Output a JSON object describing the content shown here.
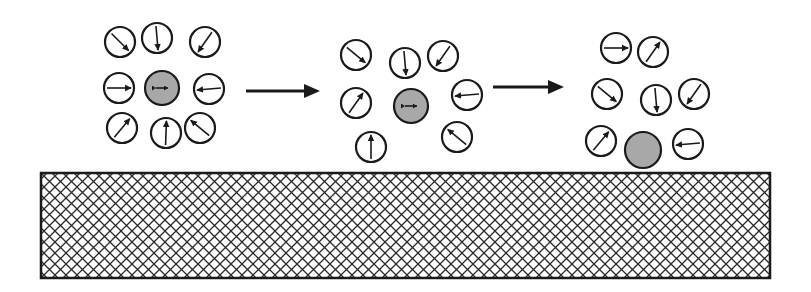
{
  "diagram": {
    "type": "process-sequence",
    "colors": {
      "stroke": "#1a1a1a",
      "particle_fill": "#a8a8a8",
      "background": "#ffffff",
      "hatch": "#2a2a2a"
    },
    "stages": [
      {
        "label": "stage-1",
        "particle": {
          "cx": 162,
          "cy": 88,
          "r": 17,
          "has_double_arrow": true
        },
        "dipoles": [
          {
            "cx": 120,
            "cy": 42,
            "angle": 225
          },
          {
            "cx": 157,
            "cy": 38,
            "angle": 265
          },
          {
            "cx": 205,
            "cy": 42,
            "angle": 305
          },
          {
            "cx": 119,
            "cy": 88,
            "angle": 180
          },
          {
            "cx": 209,
            "cy": 89,
            "angle": 355
          },
          {
            "cx": 122,
            "cy": 128,
            "angle": 130
          },
          {
            "cx": 166,
            "cy": 133,
            "angle": 92
          },
          {
            "cx": 200,
            "cy": 128,
            "angle": 40
          }
        ]
      },
      {
        "label": "stage-2",
        "particle": {
          "cx": 411,
          "cy": 106,
          "r": 17,
          "has_double_arrow": true
        },
        "dipoles": [
          {
            "cx": 356,
            "cy": 55,
            "angle": 220
          },
          {
            "cx": 405,
            "cy": 63,
            "angle": 265
          },
          {
            "cx": 443,
            "cy": 56,
            "angle": 305
          },
          {
            "cx": 356,
            "cy": 103,
            "angle": 125
          },
          {
            "cx": 467,
            "cy": 95,
            "angle": 355
          },
          {
            "cx": 371,
            "cy": 147,
            "angle": 90
          },
          {
            "cx": 457,
            "cy": 137,
            "angle": 40
          }
        ]
      },
      {
        "label": "stage-3",
        "particle": {
          "cx": 643,
          "cy": 150,
          "r": 18,
          "has_double_arrow": false
        },
        "dipoles": [
          {
            "cx": 616,
            "cy": 48,
            "angle": 180
          },
          {
            "cx": 653,
            "cy": 52,
            "angle": 125
          },
          {
            "cx": 607,
            "cy": 94,
            "angle": 220
          },
          {
            "cx": 656,
            "cy": 100,
            "angle": 265
          },
          {
            "cx": 694,
            "cy": 94,
            "angle": 305
          },
          {
            "cx": 601,
            "cy": 141,
            "angle": 130
          },
          {
            "cx": 688,
            "cy": 144,
            "angle": 355
          }
        ]
      }
    ],
    "transition_arrows": [
      {
        "x1": 246,
        "y1": 91,
        "x2": 320,
        "y2": 91
      },
      {
        "x1": 493,
        "y1": 87,
        "x2": 564,
        "y2": 87
      }
    ],
    "substrate": {
      "x": 41,
      "y": 173,
      "width": 729,
      "height": 105,
      "pattern": "cross-hatch"
    },
    "dipole_radius": 15
  }
}
